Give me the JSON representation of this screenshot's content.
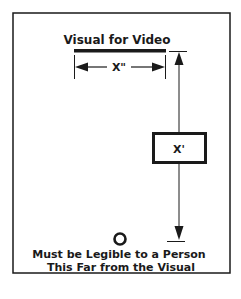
{
  "diagram": {
    "title": "Visual for Video",
    "width_label": "X\"",
    "distance_label": "X'",
    "caption_line1": "Must be Legible to a Person",
    "caption_line2": "This Far from the Visual",
    "colors": {
      "ink": "#1a1a1a",
      "background": "#ffffff"
    }
  }
}
